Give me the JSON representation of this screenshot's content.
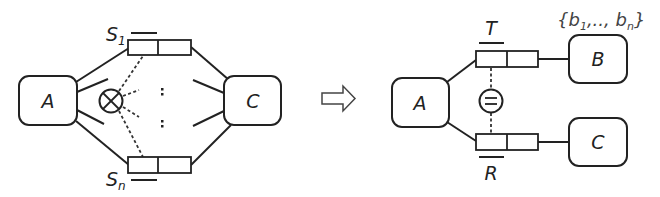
{
  "left_diagram": {
    "nodes": {
      "A": {
        "label": "A"
      },
      "C": {
        "label": "C"
      }
    },
    "queues": {
      "top": {
        "label": "S",
        "subscript": "1"
      },
      "bottom": {
        "label": "S",
        "subscript": "n"
      }
    },
    "operator": {
      "symbol": "otimes",
      "meaning": "parallel composition"
    },
    "ellipsis": [
      ":",
      ":"
    ]
  },
  "transform_arrow": {
    "icon": "hollow-right-arrow"
  },
  "right_diagram": {
    "nodes": {
      "A": {
        "label": "A"
      },
      "B": {
        "label": "B"
      },
      "C": {
        "label": "C"
      }
    },
    "queues": {
      "top": {
        "label": "T"
      },
      "bottom": {
        "label": "R"
      }
    },
    "operator": {
      "symbol": "equals-circle"
    },
    "set_annotation": {
      "open": "{b",
      "sub1": "1",
      "mid": ",.., b",
      "subn": "n",
      "close": "}"
    }
  },
  "colors": {
    "stroke": "#222222",
    "annotation": "#444444",
    "background": "#ffffff"
  }
}
